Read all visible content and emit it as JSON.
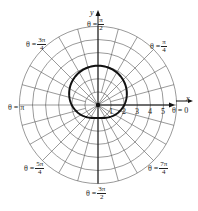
{
  "chart_data": {
    "type": "line",
    "subtype": "polar",
    "title": "",
    "equation": "r = 2 + sin θ",
    "xlabel": "x",
    "ylabel": "y",
    "radial_ticks": [
      "1",
      "2",
      "3",
      "4",
      "5"
    ],
    "radial_range": [
      0,
      6
    ],
    "grid": {
      "circles": [
        1,
        2,
        3,
        4,
        5,
        6
      ],
      "radial_step_deg": 15
    },
    "angle_labels": [
      {
        "id": "a0",
        "prefix": "θ = ",
        "num": "0",
        "den": ""
      },
      {
        "id": "a45",
        "prefix": "θ = ",
        "num": "π",
        "den": "4"
      },
      {
        "id": "a90",
        "prefix": "θ = ",
        "num": "π",
        "den": "2"
      },
      {
        "id": "a135",
        "prefix": "θ = ",
        "num": "3π",
        "den": "4"
      },
      {
        "id": "a180",
        "prefix": "θ = ",
        "num": "π",
        "den": ""
      },
      {
        "id": "a225",
        "prefix": "θ = ",
        "num": "5π",
        "den": "4"
      },
      {
        "id": "a270",
        "prefix": "θ = ",
        "num": "3π",
        "den": "2"
      },
      {
        "id": "a315",
        "prefix": "θ = ",
        "num": "7π",
        "den": "4"
      }
    ],
    "series": [
      {
        "name": "r = 2 + sin θ",
        "theta_deg": [
          0,
          30,
          60,
          90,
          120,
          150,
          180,
          210,
          240,
          270,
          300,
          330,
          360
        ],
        "r": [
          2,
          2.5,
          2.87,
          3,
          2.87,
          2.5,
          2,
          1.5,
          1.13,
          1,
          1.13,
          1.5,
          2
        ]
      }
    ]
  },
  "labels": {
    "x_axis": "x",
    "y_axis": "y",
    "theta_eq": "θ = ",
    "ticks": [
      "1",
      "2",
      "3",
      "4",
      "5"
    ],
    "a0": {
      "text": "θ = 0"
    },
    "a180": {
      "text": "θ = π"
    },
    "a45": {
      "num": "π",
      "den": "4"
    },
    "a90": {
      "num": "π",
      "den": "2"
    },
    "a135": {
      "num": "3π",
      "den": "4"
    },
    "a225": {
      "num": "5π",
      "den": "4"
    },
    "a270": {
      "num": "3π",
      "den": "2"
    },
    "a315": {
      "num": "7π",
      "den": "4"
    }
  }
}
